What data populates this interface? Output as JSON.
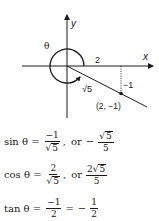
{
  "diagram": {
    "axis_labels": {
      "x": "x",
      "y": "y"
    },
    "angle_label": "θ",
    "adjacent_label": "2",
    "opposite_label": "−1",
    "hypotenuse_label": "√5",
    "point_label": "(2, −1)",
    "point": {
      "x": 2,
      "y": -1
    }
  },
  "equations": [
    {
      "fn": "sin θ =",
      "frac1": {
        "num": "−1",
        "den_sqrt": "5",
        "den_coef": ""
      },
      "or": "or",
      "sign": "−",
      "frac2": {
        "num_coef": "",
        "num_sqrt": "5",
        "den": "5"
      }
    },
    {
      "fn": "cos θ =",
      "frac1": {
        "num": "2",
        "den_sqrt": "5",
        "den_coef": ""
      },
      "or": "or",
      "sign": "",
      "frac2": {
        "num_coef": "2",
        "num_sqrt": "5",
        "den": "5"
      }
    },
    {
      "fn": "tan θ =",
      "frac1": {
        "num": "−1",
        "den": "2"
      },
      "eq": "=",
      "sign": "−",
      "frac2": {
        "num": "1",
        "den": "2"
      }
    }
  ]
}
